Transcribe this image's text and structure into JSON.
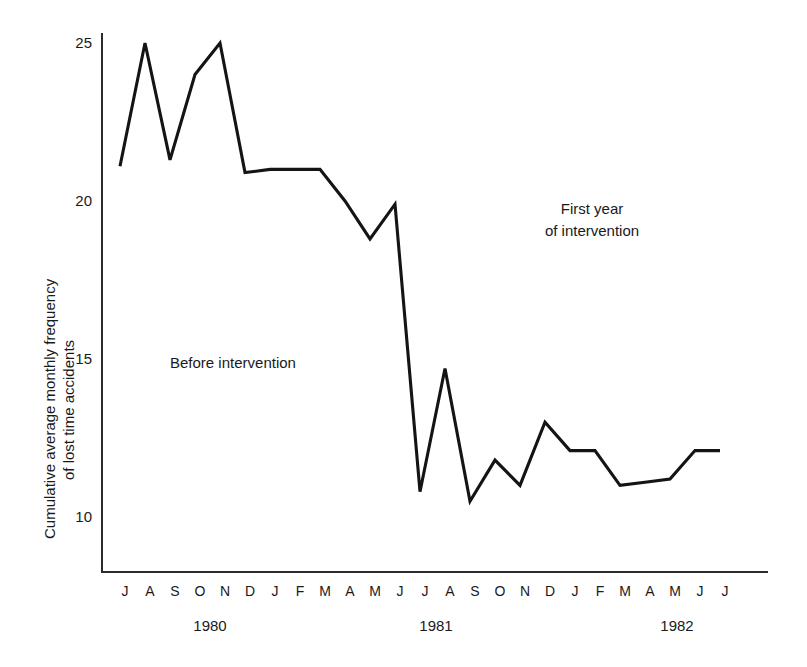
{
  "chart_data": {
    "type": "line",
    "title": "",
    "xlabel": "",
    "ylabel": "Cumulative average monthly frequency of lost time accidents",
    "ylabel_lines": [
      "Cumulative average monthly frequency",
      "of lost time accidents"
    ],
    "ylim": [
      10,
      25
    ],
    "yticks": [
      10,
      15,
      20,
      25
    ],
    "ytick_labels": [
      "10",
      "15",
      "20",
      "25"
    ],
    "grid": false,
    "legend": null,
    "x_group_labels": [
      "1980",
      "1981",
      "1982"
    ],
    "categories": [
      "J",
      "A",
      "S",
      "O",
      "N",
      "D",
      "J",
      "F",
      "M",
      "A",
      "M",
      "J",
      "J",
      "A",
      "S",
      "O",
      "N",
      "D",
      "J",
      "F",
      "M",
      "A",
      "M",
      "J",
      "J"
    ],
    "x_full": [
      "Jul 1980",
      "Aug 1980",
      "Sep 1980",
      "Oct 1980",
      "Nov 1980",
      "Dec 1980",
      "Jan 1981",
      "Feb 1981",
      "Mar 1981",
      "Apr 1981",
      "May 1981",
      "Jun 1981",
      "Jul 1981",
      "Aug 1981",
      "Sep 1981",
      "Oct 1981",
      "Nov 1981",
      "Dec 1981",
      "Jan 1982",
      "Feb 1982",
      "Mar 1982",
      "Apr 1982",
      "May 1982",
      "Jun 1982",
      "Jul 1982"
    ],
    "values": [
      21.1,
      25.0,
      21.3,
      24.0,
      25.0,
      20.9,
      21.0,
      21.0,
      21.0,
      20.0,
      18.8,
      19.9,
      10.8,
      14.7,
      10.5,
      11.8,
      11.0,
      13.0,
      12.1,
      12.1,
      11.0,
      11.1,
      11.2,
      12.1,
      12.1
    ],
    "annotations": [
      {
        "text": "Before intervention",
        "x_month": "Mar 1980 region",
        "value_region": "left half"
      },
      {
        "text": "First year of intervention",
        "lines": [
          "First year",
          "of intervention"
        ],
        "value_region": "right half"
      }
    ],
    "line_color": "#141414"
  },
  "axes": {
    "y_tick_labels": [
      "25",
      "20",
      "15",
      "10"
    ],
    "month_labels": [
      "J",
      "A",
      "S",
      "O",
      "N",
      "D",
      "J",
      "F",
      "M",
      "A",
      "M",
      "J",
      "J",
      "A",
      "S",
      "O",
      "N",
      "D",
      "J",
      "F",
      "M",
      "A",
      "M",
      "J",
      "J"
    ],
    "year_labels": [
      "1980",
      "1981",
      "1982"
    ]
  },
  "annotations": {
    "before": "Before intervention",
    "first_line1": "First year",
    "first_line2": "of intervention"
  },
  "y_axis_title": {
    "line1": "Cumulative average monthly frequency",
    "line2": "of lost time accidents"
  }
}
